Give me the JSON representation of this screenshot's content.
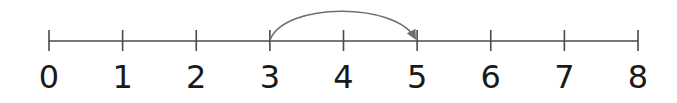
{
  "diagram": {
    "type": "number-line",
    "min": 0,
    "max": 8,
    "tick_labels": [
      "0",
      "1",
      "2",
      "3",
      "4",
      "5",
      "6",
      "7",
      "8"
    ],
    "jump": {
      "from": 3,
      "to": 5,
      "direction": "right",
      "shape": "arrow-arc"
    },
    "colors": {
      "line": "#4a4a4a",
      "arc": "#6e6e6e",
      "text": "#1a1a1a"
    }
  }
}
